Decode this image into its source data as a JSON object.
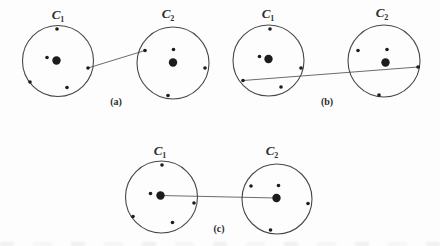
{
  "figure": {
    "colors": {
      "background": "#fdfdfd",
      "circle_stroke": "#474747",
      "dot_fill": "#1c1c1c",
      "link_stroke": "#5a5a5a",
      "label_color": "#2e2e2e"
    },
    "dot_radius_small": 1.8,
    "dot_radius_large": 4.2,
    "panels": [
      {
        "id": "a",
        "label": "(a)",
        "label_pos": {
          "x": 116,
          "y": 96
        },
        "clusters": [
          {
            "id": "a-c1",
            "name": "C",
            "subscript": "1",
            "label_pos": {
              "x": 58,
              "y": 19
            },
            "circle": {
              "cx": 58,
              "cy": 61,
              "r": 35.5
            },
            "points": [
              {
                "x": 57,
                "y": 29,
                "size": "small"
              },
              {
                "x": 47,
                "y": 57.5,
                "size": "small"
              },
              {
                "x": 56.5,
                "y": 60.5,
                "size": "large"
              },
              {
                "x": 88,
                "y": 68,
                "size": "small"
              },
              {
                "x": 30,
                "y": 82,
                "size": "small"
              },
              {
                "x": 67,
                "y": 87.5,
                "size": "small"
              }
            ]
          },
          {
            "id": "a-c2",
            "name": "C",
            "subscript": "2",
            "label_pos": {
              "x": 168,
              "y": 18
            },
            "circle": {
              "cx": 173,
              "cy": 63,
              "r": 36
            },
            "points": [
              {
                "x": 145,
                "y": 50.5,
                "size": "small"
              },
              {
                "x": 173.5,
                "y": 49.5,
                "size": "small"
              },
              {
                "x": 173,
                "y": 62.5,
                "size": "large"
              },
              {
                "x": 205,
                "y": 68,
                "size": "small"
              },
              {
                "x": 168,
                "y": 95.5,
                "size": "small"
              }
            ]
          }
        ],
        "link": {
          "x1": 88,
          "y1": 68,
          "x2": 145,
          "y2": 50.5
        }
      },
      {
        "id": "b",
        "label": "(b)",
        "label_pos": {
          "x": 327,
          "y": 96
        },
        "clusters": [
          {
            "id": "b-c1",
            "name": "C",
            "subscript": "1",
            "label_pos": {
              "x": 268,
              "y": 18
            },
            "circle": {
              "cx": 268.5,
              "cy": 60.5,
              "r": 35.5
            },
            "points": [
              {
                "x": 270,
                "y": 29,
                "size": "small"
              },
              {
                "x": 259.5,
                "y": 56.5,
                "size": "small"
              },
              {
                "x": 268.5,
                "y": 59,
                "size": "large"
              },
              {
                "x": 301,
                "y": 68,
                "size": "small"
              },
              {
                "x": 243,
                "y": 80.5,
                "size": "small"
              },
              {
                "x": 281,
                "y": 87,
                "size": "small"
              }
            ]
          },
          {
            "id": "b-c2",
            "name": "C",
            "subscript": "2",
            "label_pos": {
              "x": 382,
              "y": 17
            },
            "circle": {
              "cx": 384,
              "cy": 61,
              "r": 36
            },
            "points": [
              {
                "x": 358,
                "y": 50.5,
                "size": "small"
              },
              {
                "x": 387,
                "y": 49.5,
                "size": "small"
              },
              {
                "x": 385.5,
                "y": 62.5,
                "size": "large"
              },
              {
                "x": 418,
                "y": 67,
                "size": "small"
              },
              {
                "x": 379,
                "y": 95,
                "size": "small"
              }
            ]
          }
        ],
        "link": {
          "x1": 243,
          "y1": 80.5,
          "x2": 418,
          "y2": 67
        }
      },
      {
        "id": "c",
        "label": "(c)",
        "label_pos": {
          "x": 219,
          "y": 223
        },
        "clusters": [
          {
            "id": "c-c1",
            "name": "C",
            "subscript": "1",
            "label_pos": {
              "x": 160,
              "y": 155
            },
            "circle": {
              "cx": 161.5,
              "cy": 197,
              "r": 36
            },
            "points": [
              {
                "x": 162,
                "y": 165,
                "size": "small"
              },
              {
                "x": 150.5,
                "y": 193.5,
                "size": "small"
              },
              {
                "x": 160.5,
                "y": 195.5,
                "size": "large"
              },
              {
                "x": 194,
                "y": 203,
                "size": "small"
              },
              {
                "x": 133,
                "y": 216.5,
                "size": "small"
              },
              {
                "x": 172.5,
                "y": 222.5,
                "size": "small"
              }
            ]
          },
          {
            "id": "c-c2",
            "name": "C",
            "subscript": "2",
            "label_pos": {
              "x": 272,
              "y": 155
            },
            "circle": {
              "cx": 277,
              "cy": 199,
              "r": 35
            },
            "points": [
              {
                "x": 251,
                "y": 186,
                "size": "small"
              },
              {
                "x": 278.5,
                "y": 185.5,
                "size": "small"
              },
              {
                "x": 276.5,
                "y": 198,
                "size": "large"
              },
              {
                "x": 308,
                "y": 203.5,
                "size": "small"
              },
              {
                "x": 270.5,
                "y": 230,
                "size": "small"
              }
            ]
          }
        ],
        "link": {
          "x1": 160.5,
          "y1": 195.5,
          "x2": 276.5,
          "y2": 198
        }
      }
    ]
  }
}
